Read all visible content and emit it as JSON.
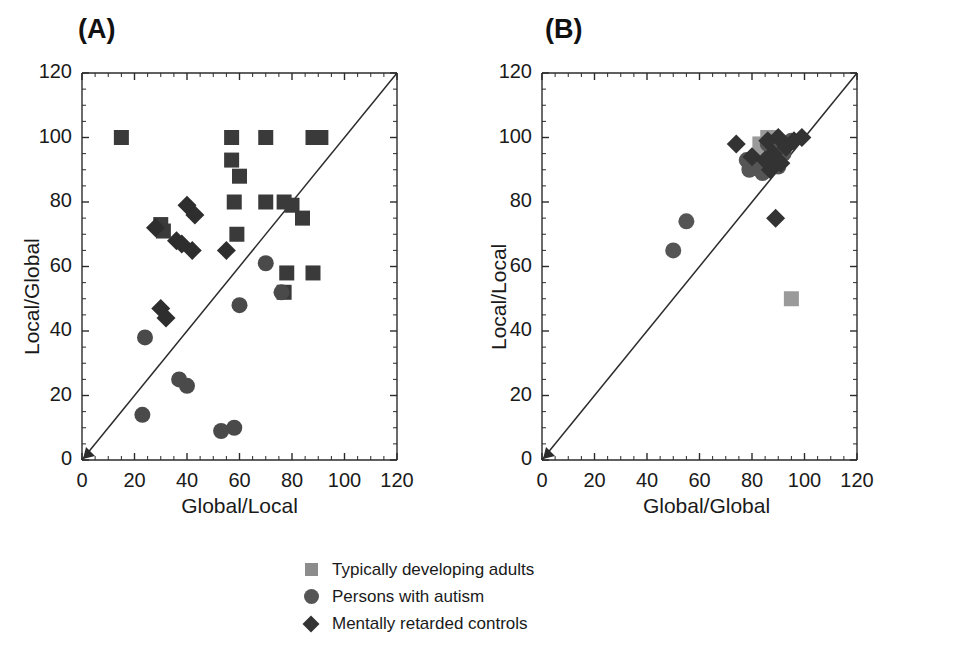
{
  "figure": {
    "panels": [
      {
        "letter": "(A)",
        "xlabel": "Global/Local",
        "ylabel": "Local/Global"
      },
      {
        "letter": "(B)",
        "xlabel": "Global/Global",
        "ylabel": "Local/Local"
      }
    ]
  },
  "legend": {
    "items": [
      {
        "marker": "square-marker",
        "label": "Typically developing adults",
        "color": "#8c8c8c"
      },
      {
        "marker": "circle-marker",
        "label": "Persons with autism",
        "color": "#555555"
      },
      {
        "marker": "diamond-marker",
        "label": "Mentally retarded controls",
        "color": "#333333"
      }
    ]
  },
  "axis": {
    "tick_labels": [
      "0",
      "20",
      "40",
      "60",
      "80",
      "100",
      "120"
    ],
    "ticks": [
      0,
      20,
      40,
      60,
      80,
      100,
      120
    ],
    "min": 0,
    "max": 120,
    "minor_ticks_per_major": 4
  },
  "chart_data": [
    {
      "type": "scatter",
      "title": "(A)",
      "xlabel": "Global/Local",
      "ylabel": "Local/Global",
      "xlim": [
        0,
        120
      ],
      "ylim": [
        0,
        120
      ],
      "grid": false,
      "legend_position": "below-figure",
      "annotations": [
        "identity line y = x with arrowhead at origin"
      ],
      "series": [
        {
          "name": "Typically developing adults",
          "marker": "square",
          "color": "#3a3a3a",
          "points": [
            [
              15,
              100
            ],
            [
              57,
              100
            ],
            [
              70,
              100
            ],
            [
              88,
              100
            ],
            [
              91,
              100
            ],
            [
              57,
              93
            ],
            [
              60,
              88
            ],
            [
              58,
              80
            ],
            [
              70,
              80
            ],
            [
              77,
              80
            ],
            [
              80,
              79
            ],
            [
              59,
              70
            ],
            [
              78,
              58
            ],
            [
              88,
              58
            ],
            [
              84,
              75
            ],
            [
              30,
              73
            ],
            [
              31,
              71
            ],
            [
              77,
              52
            ]
          ]
        },
        {
          "name": "Persons with autism",
          "marker": "circle",
          "color": "#4a4a4a",
          "points": [
            [
              23,
              14
            ],
            [
              24,
              38
            ],
            [
              37,
              25
            ],
            [
              40,
              23
            ],
            [
              53,
              9
            ],
            [
              58,
              10
            ],
            [
              60,
              48
            ],
            [
              70,
              61
            ],
            [
              76,
              52
            ]
          ]
        },
        {
          "name": "Mentally retarded controls",
          "marker": "diamond",
          "color": "#2e2e2e",
          "points": [
            [
              28,
              72
            ],
            [
              40,
              79
            ],
            [
              43,
              76
            ],
            [
              36,
              68
            ],
            [
              38,
              67
            ],
            [
              42,
              65
            ],
            [
              30,
              47
            ],
            [
              32,
              44
            ],
            [
              55,
              65
            ]
          ]
        }
      ]
    },
    {
      "type": "scatter",
      "title": "(B)",
      "xlabel": "Global/Global",
      "ylabel": "Local/Local",
      "xlim": [
        0,
        120
      ],
      "ylim": [
        0,
        120
      ],
      "grid": false,
      "legend_position": "below-figure",
      "annotations": [
        "identity line y = x with arrowhead at origin"
      ],
      "series": [
        {
          "name": "Typically developing adults",
          "marker": "square",
          "color": "#9a9a9a",
          "points": [
            [
              83,
              98
            ],
            [
              86,
              100
            ],
            [
              88,
              100
            ],
            [
              90,
              98
            ],
            [
              84,
              95
            ],
            [
              87,
              96
            ],
            [
              89,
              94
            ],
            [
              91,
              97
            ],
            [
              95,
              50
            ]
          ]
        },
        {
          "name": "Persons with autism",
          "marker": "circle",
          "color": "#555555",
          "points": [
            [
              50,
              65
            ],
            [
              55,
              74
            ],
            [
              78,
              93
            ],
            [
              79,
              90
            ],
            [
              81,
              92
            ],
            [
              86,
              98
            ],
            [
              88,
              96
            ],
            [
              89,
              92
            ],
            [
              90,
              91
            ],
            [
              92,
              95
            ],
            [
              95,
              99
            ],
            [
              84,
              89
            ]
          ]
        },
        {
          "name": "Mentally retarded controls",
          "marker": "diamond",
          "color": "#333333",
          "points": [
            [
              74,
              98
            ],
            [
              80,
              94
            ],
            [
              86,
              99
            ],
            [
              88,
              95
            ],
            [
              90,
              100
            ],
            [
              91,
              92
            ],
            [
              93,
              97
            ],
            [
              96,
              99
            ],
            [
              99,
              100
            ],
            [
              89,
              75
            ],
            [
              87,
              90
            ],
            [
              85,
              93
            ]
          ]
        }
      ]
    }
  ]
}
